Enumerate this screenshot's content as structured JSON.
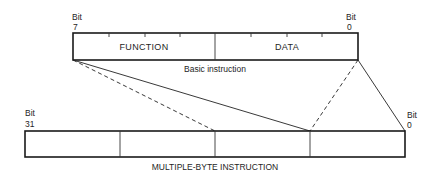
{
  "basic_instruction": {
    "left_bit_label": "Bit",
    "left_bit_number": "7",
    "right_bit_label": "Bit",
    "right_bit_number": "0",
    "fields": [
      {
        "label": "FUNCTION"
      },
      {
        "label": "DATA"
      }
    ],
    "caption": "Basic instruction"
  },
  "multiple_byte_instruction": {
    "left_bit_label": "Bit",
    "left_bit_number": "31",
    "right_bit_label": "Bit",
    "right_bit_number": "0",
    "byte_count": 4,
    "caption": "MULTIPLE-BYTE INSTRUCTION"
  },
  "connectors": [
    {
      "from": "basic-left",
      "to": "byte-3-boundary",
      "style": "solid"
    },
    {
      "from": "basic-left",
      "to": "byte-2-boundary",
      "style": "dashed"
    },
    {
      "from": "basic-right",
      "to": "byte-3-boundary",
      "style": "dashed"
    },
    {
      "from": "basic-right",
      "to": "multi-right",
      "style": "solid"
    }
  ]
}
